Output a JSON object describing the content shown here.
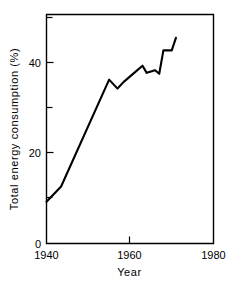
{
  "chart_data": {
    "type": "line",
    "title": "",
    "xlabel": "Year",
    "ylabel": "Total  energy  consumption  (%)",
    "xlim": [
      1940,
      1980
    ],
    "ylim": [
      0,
      51
    ],
    "grid": false,
    "legend": false,
    "x_major_ticks": [
      1940,
      1960,
      1980
    ],
    "x_major_tick_labels": [
      "1940",
      "1960",
      "1980"
    ],
    "y_major_ticks": [
      0,
      20,
      40
    ],
    "y_major_tick_labels": [
      "0",
      "20",
      "40"
    ],
    "y_minor_ticks": [
      10,
      30,
      50
    ],
    "series": [
      {
        "name": "Total energy consumption",
        "x": [
          1940,
          1943.5,
          1955,
          1957,
          1958.5,
          1961,
          1963,
          1964,
          1966,
          1967,
          1968,
          1970,
          1971
        ],
        "values": [
          9.3,
          12.7,
          36.5,
          34.5,
          36.0,
          38.0,
          39.6,
          38.0,
          38.6,
          37.8,
          43.0,
          43.0,
          45.8
        ]
      }
    ]
  },
  "axis_labels": {
    "x_title": "Year",
    "y_title": "Total  energy  consumption  (%)",
    "x_ticks": [
      "1940",
      "1960",
      "1980"
    ],
    "y_ticks": [
      "40",
      "20",
      "0"
    ]
  }
}
